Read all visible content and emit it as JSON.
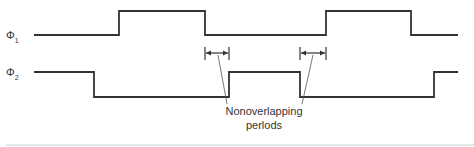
{
  "diagram": {
    "signals": [
      {
        "name": "Φ",
        "subscript": "1",
        "transitions": [
          "low",
          "high",
          "low",
          "high",
          "low"
        ]
      },
      {
        "name": "Φ",
        "subscript": "2",
        "transitions": [
          "high",
          "low",
          "high",
          "low",
          "high"
        ]
      }
    ],
    "annotation": {
      "line1": "Nonoverlapping",
      "line2": "perlods"
    },
    "colors": {
      "stroke": "#333333",
      "background": "#ffffff"
    }
  }
}
